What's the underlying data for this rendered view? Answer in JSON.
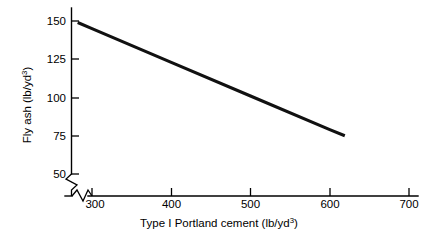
{
  "chart_data": {
    "type": "line",
    "title": "",
    "xlabel": "Type I Portland cement (lb/yd3)",
    "ylabel": "Fly ash (lb/yd3)",
    "xlabel_base": "Type I Portland cement (lb/yd",
    "xlabel_sup": "3",
    "xlabel_tail": ")",
    "ylabel_base": "Fly ash (lb/yd",
    "ylabel_sup": "3",
    "ylabel_tail": ")",
    "x_unit": "lb/yd3",
    "y_unit": "lb/yd3",
    "xlim": [
      265,
      720
    ],
    "ylim": [
      42,
      158
    ],
    "xticks": [
      300,
      400,
      500,
      600,
      700
    ],
    "yticks": [
      50,
      75,
      100,
      125,
      150
    ],
    "xticklabels": [
      "300",
      "400",
      "500",
      "600",
      "700"
    ],
    "yticklabels": [
      "50",
      "75",
      "100",
      "125",
      "150"
    ],
    "grid": false,
    "legend": false,
    "legend_position": "none",
    "axis_break_x": true,
    "axis_break_y": true,
    "line_color": "#111111",
    "axis_color": "#000000",
    "background_color": "#ffffff",
    "series": [
      {
        "name": "Fly ash vs cement",
        "x": [
          282,
          619
        ],
        "y": [
          149,
          75
        ],
        "points": [
          {
            "x": 282,
            "y": 149
          },
          {
            "x": 300,
            "y": 145
          },
          {
            "x": 400,
            "y": 123
          },
          {
            "x": 500,
            "y": 101
          },
          {
            "x": 600,
            "y": 79
          },
          {
            "x": 619,
            "y": 75
          }
        ]
      }
    ],
    "annotations": []
  },
  "xtick_labels": {
    "t0": "300",
    "t1": "400",
    "t2": "500",
    "t3": "600",
    "t4": "700"
  },
  "ytick_labels": {
    "t0": "50",
    "t1": "75",
    "t2": "100",
    "t3": "125",
    "t4": "150"
  }
}
